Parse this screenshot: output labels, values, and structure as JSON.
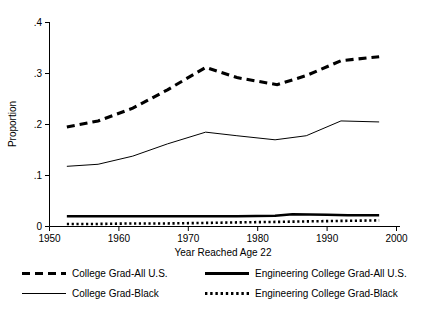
{
  "chart_data": {
    "type": "line",
    "title": "",
    "xlabel": "Year Reached Age 22",
    "ylabel": "Proportion",
    "xlim": [
      1950,
      2000
    ],
    "ylim": [
      0,
      0.4
    ],
    "xticks": [
      1950,
      1960,
      1970,
      1980,
      1990,
      2000
    ],
    "xtick_labels": [
      "1950",
      "1960",
      "1970",
      "1980",
      "1990",
      "2000"
    ],
    "yticks": [
      0,
      0.1,
      0.2,
      0.3,
      0.4
    ],
    "ytick_labels": [
      "0",
      ".1",
      ".2",
      ".3",
      ".4"
    ],
    "grid": false,
    "legend_position": "below-axes",
    "series": [
      {
        "name": "College Grad-All U.S.",
        "style": "dashed-thick",
        "color": "#000000",
        "x": [
          1952.5,
          1957,
          1962,
          1967,
          1972.5,
          1977,
          1982.8,
          1987,
          1992,
          1997.5
        ],
        "values": [
          0.195,
          0.207,
          0.232,
          0.268,
          0.312,
          0.292,
          0.278,
          0.296,
          0.325,
          0.333
        ]
      },
      {
        "name": "College Grad-Black",
        "style": "solid-thin",
        "color": "#000000",
        "x": [
          1952.5,
          1957,
          1962,
          1967,
          1972.5,
          1977,
          1982.5,
          1987,
          1992,
          1997.5
        ],
        "values": [
          0.118,
          0.122,
          0.138,
          0.162,
          0.185,
          0.178,
          0.17,
          0.178,
          0.207,
          0.205
        ]
      },
      {
        "name": "Engineering College Grad-All U.S.",
        "style": "solid-thick",
        "color": "#000000",
        "x": [
          1952.5,
          1957,
          1962,
          1967,
          1972.5,
          1977,
          1982.5,
          1985,
          1990,
          1993,
          1997.5
        ],
        "values": [
          0.02,
          0.02,
          0.02,
          0.02,
          0.02,
          0.02,
          0.021,
          0.024,
          0.023,
          0.022,
          0.022
        ]
      },
      {
        "name": "Engineering College Grad-Black",
        "style": "dotted-thick",
        "color": "#000000",
        "x": [
          1952.5,
          1957,
          1962,
          1967,
          1972.5,
          1977,
          1982.5,
          1987,
          1992,
          1997.5
        ],
        "values": [
          0.005,
          0.005,
          0.006,
          0.006,
          0.007,
          0.008,
          0.009,
          0.01,
          0.011,
          0.012
        ]
      }
    ]
  },
  "legend": {
    "entries": [
      {
        "label": "College Grad-All U.S.",
        "swatch": "dashed-thick-swatch"
      },
      {
        "label": "Engineering College Grad-All U.S.",
        "swatch": "solid-thick-swatch"
      },
      {
        "label": "College Grad-Black",
        "swatch": "solid-thin-swatch"
      },
      {
        "label": "Engineering College Grad-Black",
        "swatch": "dotted-thick-swatch"
      }
    ]
  },
  "axes": {
    "x_title": "Year Reached Age 22",
    "y_title": "Proportion",
    "x_tick_0": "1950",
    "x_tick_1": "1960",
    "x_tick_2": "1970",
    "x_tick_3": "1980",
    "x_tick_4": "1990",
    "x_tick_5": "2000",
    "y_tick_0": "0",
    "y_tick_1": ".1",
    "y_tick_2": ".2",
    "y_tick_3": ".3",
    "y_tick_4": ".4"
  },
  "colors": {
    "ink": "#000000",
    "background": "#ffffff"
  }
}
